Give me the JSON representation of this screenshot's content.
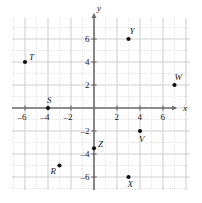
{
  "chart_data": {
    "type": "scatter",
    "title": "",
    "xlabel": "x",
    "ylabel": "y",
    "xlim": [
      -7.2,
      8.4
    ],
    "ylim": [
      -7.8,
      8.2
    ],
    "grid": true,
    "grid_step": 1,
    "major_step": 2,
    "legend": "none",
    "xticks": [
      -6,
      -4,
      -2,
      2,
      4,
      6
    ],
    "yticks": [
      6,
      4,
      2,
      -2,
      -4,
      -6
    ],
    "xtick_labels": [
      "–6",
      "–4",
      "–2",
      "2",
      "4",
      "6"
    ],
    "ytick_labels": [
      "6",
      "4",
      "2",
      "–2",
      "–4",
      "–6"
    ],
    "points": [
      {
        "label": "T",
        "x": -6,
        "y": 4,
        "label_dx": 4,
        "label_dy": -9
      },
      {
        "label": "S",
        "x": -4,
        "y": 0,
        "label_dx": -1,
        "label_dy": -12
      },
      {
        "label": "Y",
        "x": 3,
        "y": 6,
        "label_dx": 1,
        "label_dy": -12
      },
      {
        "label": "W",
        "x": 7,
        "y": 2,
        "label_dx": 0,
        "label_dy": -12
      },
      {
        "label": "V",
        "x": 4,
        "y": -2,
        "label_dx": -1,
        "label_dy": 4
      },
      {
        "label": "Z",
        "x": 0,
        "y": -3.5,
        "label_dx": 4,
        "label_dy": -8
      },
      {
        "label": "R",
        "x": -3,
        "y": -5,
        "label_dx": -9,
        "label_dy": 1
      },
      {
        "label": "X",
        "x": 3,
        "y": -6,
        "label_dx": -1,
        "label_dy": 3
      }
    ]
  },
  "axes": {
    "x_name": "x",
    "y_name": "y"
  },
  "colors": {
    "axis": "#6e6e6e",
    "grid_minor": "#dcdcdc",
    "grid_major": "#cfcfcf",
    "point": "#111111",
    "text": "#1a1a1a",
    "background": "#ffffff"
  }
}
